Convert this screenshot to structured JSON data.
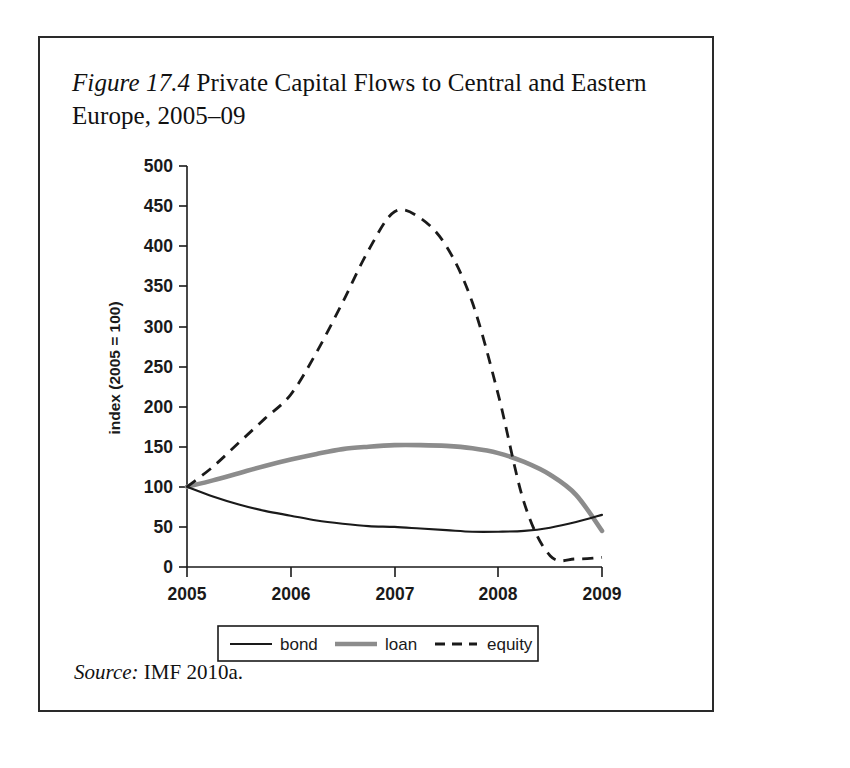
{
  "figure": {
    "number_label": "Figure 17.4",
    "caption_text": "Private Capital Flows to Central and Eastern Europe, 2005–09",
    "source_label": "Source:",
    "source_text": "IMF 2010a."
  },
  "colors": {
    "bond": "#1a1a1a",
    "loan": "#8c8c8c",
    "equity": "#1a1a1a",
    "axis": "#1a1a1a",
    "frame": "#2a2a2a",
    "background": "#ffffff"
  },
  "chart_data": {
    "type": "line",
    "title": "Figure 17.4 Private Capital Flows to Central and Eastern Europe, 2005–09",
    "xlabel": "",
    "ylabel": "index (2005 = 100)",
    "xlim": [
      2005,
      2009
    ],
    "ylim": [
      0,
      500
    ],
    "ytick_labels": [
      "0",
      "50",
      "100",
      "150",
      "200",
      "250",
      "300",
      "350",
      "400",
      "450",
      "500"
    ],
    "yticks": [
      0,
      50,
      100,
      150,
      200,
      250,
      300,
      350,
      400,
      450,
      500
    ],
    "xtick_labels": [
      "2005",
      "2006",
      "2007",
      "2008",
      "2009"
    ],
    "xticks": [
      2005,
      2006,
      2007,
      2008,
      2009
    ],
    "grid": false,
    "legend_position": "bottom",
    "x": [
      2005.0,
      2005.25,
      2005.5,
      2005.75,
      2006.0,
      2006.25,
      2006.5,
      2006.75,
      2007.0,
      2007.25,
      2007.5,
      2007.75,
      2008.0,
      2008.25,
      2008.5,
      2008.75,
      2009.0
    ],
    "series": [
      {
        "name": "bond",
        "style": "solid-thin",
        "color": "#1a1a1a",
        "values": [
          100,
          88,
          78,
          70,
          64,
          58,
          54,
          51,
          50,
          48,
          46,
          44,
          44,
          45,
          49,
          56,
          65
        ]
      },
      {
        "name": "loan",
        "style": "solid-thick",
        "color": "#8c8c8c",
        "values": [
          100,
          108,
          117,
          126,
          134,
          141,
          147,
          150,
          152,
          152,
          151,
          148,
          142,
          131,
          115,
          90,
          45
        ]
      },
      {
        "name": "equity",
        "style": "dashed",
        "color": "#1a1a1a",
        "values": [
          100,
          125,
          155,
          185,
          215,
          268,
          330,
          395,
          443,
          435,
          400,
          330,
          215,
          80,
          14,
          10,
          12
        ]
      }
    ]
  },
  "legend": {
    "entries": [
      {
        "label": "bond",
        "style": "solid-thin",
        "color": "#1a1a1a"
      },
      {
        "label": "loan",
        "style": "solid-thick",
        "color": "#8c8c8c"
      },
      {
        "label": "equity",
        "style": "dashed",
        "color": "#1a1a1a"
      }
    ]
  }
}
